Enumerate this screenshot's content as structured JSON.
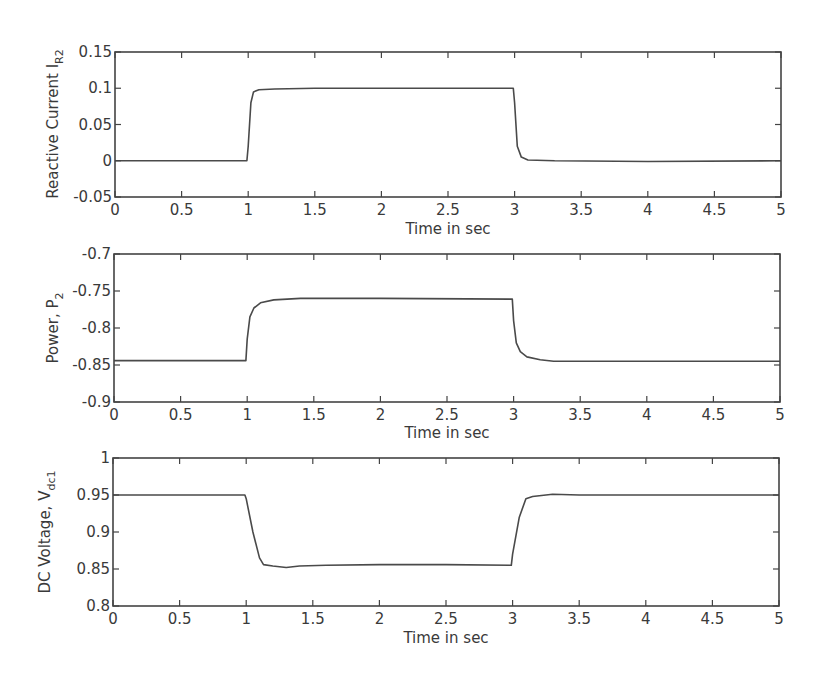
{
  "chart_data": [
    {
      "type": "line",
      "title": "",
      "xlabel": "Time in sec",
      "ylabel": "Reactive Current I",
      "ylabel_sub": "R2",
      "xlim": [
        0,
        5
      ],
      "ylim": [
        -0.05,
        0.15
      ],
      "xticks": [
        0,
        0.5,
        1,
        1.5,
        2,
        2.5,
        3,
        3.5,
        4,
        4.5,
        5
      ],
      "xtick_labels": [
        "0",
        "0.5",
        "1",
        "1.5",
        "2",
        "2.5",
        "3",
        "3.5",
        "4",
        "4.5",
        "5"
      ],
      "yticks": [
        -0.05,
        0,
        0.05,
        0.1,
        0.15
      ],
      "ytick_labels": [
        "-0.05",
        "0",
        "0.05",
        "0.1",
        "0.15"
      ],
      "grid": false,
      "series": [
        {
          "name": "I_R2",
          "x": [
            0,
            0.99,
            1.0,
            1.02,
            1.04,
            1.08,
            1.2,
            1.5,
            2.0,
            2.99,
            3.0,
            3.02,
            3.05,
            3.1,
            3.3,
            4.0,
            5.0
          ],
          "values": [
            0.0,
            0.0,
            0.02,
            0.08,
            0.095,
            0.098,
            0.099,
            0.1,
            0.1,
            0.1,
            0.08,
            0.02,
            0.005,
            0.001,
            0.0,
            -0.001,
            0.0
          ]
        }
      ]
    },
    {
      "type": "line",
      "title": "",
      "xlabel": "Time in sec",
      "ylabel": "Power, P",
      "ylabel_sub": "2",
      "xlim": [
        0,
        5
      ],
      "ylim": [
        -0.9,
        -0.7
      ],
      "xticks": [
        0,
        0.5,
        1,
        1.5,
        2,
        2.5,
        3,
        3.5,
        4,
        4.5,
        5
      ],
      "xtick_labels": [
        "0",
        "0.5",
        "1",
        "1.5",
        "2",
        "2.5",
        "3",
        "3.5",
        "4",
        "4.5",
        "5"
      ],
      "yticks": [
        -0.9,
        -0.85,
        -0.8,
        -0.75,
        -0.7
      ],
      "ytick_labels": [
        "-0.9",
        "-0.85",
        "-0.8",
        "-0.75",
        "-0.7"
      ],
      "grid": false,
      "series": [
        {
          "name": "P_2",
          "x": [
            0,
            0.99,
            1.0,
            1.02,
            1.05,
            1.1,
            1.2,
            1.4,
            2.0,
            2.99,
            3.0,
            3.02,
            3.05,
            3.1,
            3.2,
            3.3,
            4.0,
            5.0
          ],
          "values": [
            -0.844,
            -0.844,
            -0.815,
            -0.785,
            -0.773,
            -0.766,
            -0.762,
            -0.76,
            -0.76,
            -0.761,
            -0.79,
            -0.82,
            -0.832,
            -0.839,
            -0.843,
            -0.845,
            -0.845,
            -0.845
          ]
        }
      ]
    },
    {
      "type": "line",
      "title": "",
      "xlabel": "Time in sec",
      "ylabel": "DC Voltage, V",
      "ylabel_sub": "dc1",
      "xlim": [
        0,
        5
      ],
      "ylim": [
        0.8,
        1.0
      ],
      "xticks": [
        0,
        0.5,
        1,
        1.5,
        2,
        2.5,
        3,
        3.5,
        4,
        4.5,
        5
      ],
      "xtick_labels": [
        "0",
        "0.5",
        "1",
        "1.5",
        "2",
        "2.5",
        "3",
        "3.5",
        "4",
        "4.5",
        "5"
      ],
      "yticks": [
        0.8,
        0.85,
        0.9,
        0.95,
        1.0
      ],
      "ytick_labels": [
        "0.8",
        "0.85",
        "0.9",
        "0.95",
        "1"
      ],
      "grid": false,
      "series": [
        {
          "name": "V_dc1",
          "x": [
            0,
            0.99,
            1.0,
            1.05,
            1.1,
            1.13,
            1.2,
            1.3,
            1.4,
            1.6,
            2.0,
            2.5,
            2.99,
            3.0,
            3.05,
            3.1,
            3.15,
            3.3,
            3.5,
            4.0,
            5.0
          ],
          "values": [
            0.95,
            0.95,
            0.945,
            0.9,
            0.865,
            0.856,
            0.854,
            0.852,
            0.854,
            0.855,
            0.856,
            0.856,
            0.855,
            0.87,
            0.92,
            0.945,
            0.948,
            0.951,
            0.95,
            0.95,
            0.95
          ]
        }
      ]
    }
  ],
  "plots": [
    {
      "ylabel": "Reactive Current I",
      "ylabel_sub": "R2",
      "xlabel": "Time in sec"
    },
    {
      "ylabel": "Power, P",
      "ylabel_sub": "2",
      "xlabel": "Time in sec"
    },
    {
      "ylabel": "DC Voltage, V",
      "ylabel_sub": "dc1",
      "xlabel": "Time in sec"
    }
  ],
  "colors": {
    "line": "#4a4a4a",
    "axes": "#444444",
    "background": "#ffffff"
  }
}
